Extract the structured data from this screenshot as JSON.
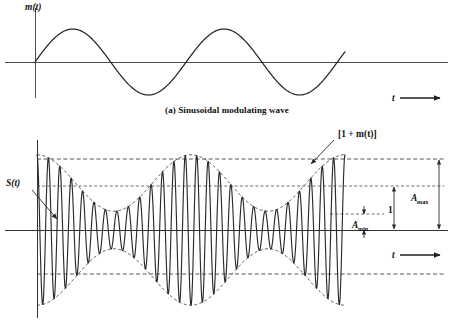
{
  "figure": {
    "background_color": "#ffffff",
    "ink_color": "#262626",
    "axis_color": "#4d4d4d"
  },
  "panel_a": {
    "caption": "(a) Sinusoidal modulating wave",
    "y_axis_label": "m(t)",
    "x_axis_label": "t",
    "x_axis_arrow": "arrow-right-icon"
  },
  "panel_b": {
    "signal_label": "S(t)",
    "envelope_label": "[1 + m(t)]",
    "x_axis_label": "t",
    "x_axis_arrow": "arrow-right-icon",
    "dimensions": [
      {
        "name": "a-max",
        "label": "A",
        "subscript": "max"
      },
      {
        "name": "unity",
        "label": "1",
        "subscript": ""
      },
      {
        "name": "a-min",
        "label": "A",
        "subscript": "min"
      }
    ]
  },
  "chart_data": [
    {
      "type": "line",
      "name": "sinusoidal-modulating-wave",
      "title": "(a) Sinusoidal modulating wave",
      "xlabel": "t",
      "ylabel": "m(t)",
      "grid": false,
      "legend": "none",
      "xlim": [
        0,
        2.05
      ],
      "ylim": [
        -1.15,
        1.15
      ],
      "axis_origin_px": {
        "x": 35,
        "y": 62
      },
      "plot_extent_px": {
        "x0": 35,
        "x1": 345,
        "axis_x1": 448,
        "amplitude": 33
      },
      "series": [
        {
          "name": "m(t)",
          "equation": "sin(2*pi*t)",
          "cycles": 2.05,
          "amplitude": 1.0,
          "x": [
            0,
            0.125,
            0.25,
            0.375,
            0.5,
            0.625,
            0.75,
            0.875,
            1.0,
            1.125,
            1.25,
            1.375,
            1.5,
            1.625,
            1.75,
            1.875,
            2.0,
            2.05
          ],
          "y": [
            0,
            0.707,
            1.0,
            0.707,
            0,
            -0.707,
            -1.0,
            -0.707,
            0,
            0.707,
            1.0,
            0.707,
            0,
            -0.707,
            -1.0,
            -0.707,
            0,
            -0.309
          ]
        }
      ]
    },
    {
      "type": "line",
      "name": "amplitude-modulated-wave",
      "title": "Amplitude modulated wave S(t)",
      "xlabel": "t",
      "ylabel": "",
      "grid": false,
      "legend": "none",
      "xlim": [
        0,
        2.0
      ],
      "ylim": [
        -2.0,
        2.0
      ],
      "axis_origin_px": {
        "x": 37,
        "y": 230
      },
      "plot_extent_px": {
        "x0": 37,
        "x1": 345,
        "axis_x1": 448
      },
      "modulation_index": 0.6,
      "carrier_cycles": 27,
      "envelope_cycles": 2,
      "envelope_phase_deg": 90,
      "scale_px_per_unit": 47,
      "guide_levels": [
        {
          "name": "a-max-upper",
          "value": 1.6,
          "y_px": 159,
          "style": "dashed"
        },
        {
          "name": "unity-upper",
          "value": 1.0,
          "y_px": 186,
          "style": "dashed"
        },
        {
          "name": "a-min-upper",
          "value": 0.4,
          "y_px": 214,
          "style": "dashed-short"
        },
        {
          "name": "zero-axis",
          "value": 0.0,
          "y_px": 230,
          "style": "solid"
        },
        {
          "name": "a-max-lower",
          "value": -1.6,
          "y_px": 274,
          "style": "dashed"
        }
      ],
      "series": [
        {
          "name": "S(t)",
          "equation": "[1 + m(t)] * cos(2*pi*fc*t)"
        },
        {
          "name": "upper envelope",
          "equation": "+[1 + m(t)]"
        },
        {
          "name": "lower envelope",
          "equation": "-[1 + m(t)]"
        }
      ]
    }
  ]
}
